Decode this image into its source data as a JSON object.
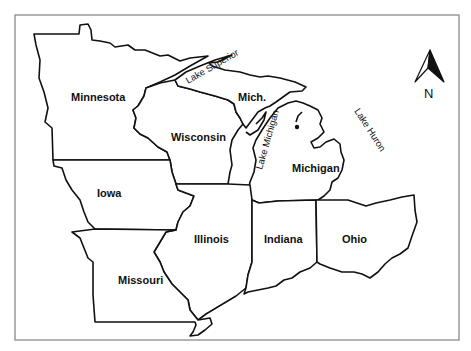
{
  "map": {
    "title": "Midwest United States",
    "frame_color": "#8a8a8a",
    "line_color": "#111111",
    "states": [
      {
        "id": "minnesota",
        "label": "Minnesota",
        "x": 125,
        "y": 101
      },
      {
        "id": "wisconsin",
        "label": "Wisconsin",
        "x": 198,
        "y": 141
      },
      {
        "id": "michigan-up",
        "label": "Mich.",
        "x": 251,
        "y": 101
      },
      {
        "id": "michigan",
        "label": "Michigan",
        "x": 316,
        "y": 172
      },
      {
        "id": "iowa",
        "label": "Iowa",
        "x": 109,
        "y": 197
      },
      {
        "id": "illinois",
        "label": "Illinois",
        "x": 212,
        "y": 242
      },
      {
        "id": "indiana",
        "label": "Indiana",
        "x": 284,
        "y": 242
      },
      {
        "id": "ohio",
        "label": "Ohio",
        "x": 354,
        "y": 242
      },
      {
        "id": "missouri",
        "label": "Missouri",
        "x": 141,
        "y": 283
      }
    ],
    "lakes": [
      {
        "id": "lake-superior",
        "label": "Lake Superior",
        "x": 210,
        "y": 77,
        "rotate": -30
      },
      {
        "id": "lake-michigan",
        "label": "Lake Michigan",
        "x": 263,
        "y": 145,
        "rotate": -72
      },
      {
        "id": "lake-huron",
        "label": "Lake Huron",
        "x": 362,
        "y": 130,
        "rotate": 55
      }
    ],
    "compass": {
      "label": "N",
      "x": 429,
      "y": 90
    }
  }
}
